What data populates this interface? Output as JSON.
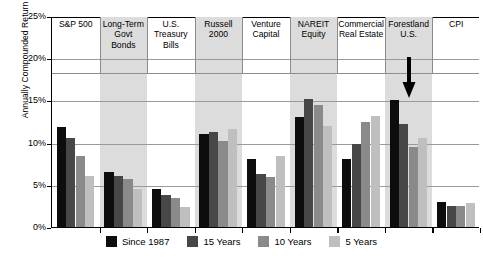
{
  "chart_data": {
    "type": "bar",
    "title": "",
    "subtitle": "",
    "xlabel": "",
    "ylabel": "Annually Compounded Return",
    "ylim": [
      0,
      25
    ],
    "ytick_labels": [
      "0%",
      "5%",
      "10%",
      "15%",
      "20%",
      "25%"
    ],
    "ytick_values": [
      0,
      5,
      10,
      15,
      20,
      25
    ],
    "grid": true,
    "legend_position": "bottom",
    "categories": [
      "S&P 500",
      "Long-Term Govt Bonds",
      "U.S. Treasury Bills",
      "Russell 2000",
      "Venture Capital",
      "NAREIT Equity",
      "Commercial Real Estate",
      "Forestland U.S.",
      "CPI"
    ],
    "category_lines": [
      [
        "S&P 500"
      ],
      [
        "Long-Term",
        "Govt",
        "Bonds"
      ],
      [
        "U.S.",
        "Treasury",
        "Bills"
      ],
      [
        "Russell",
        "2000"
      ],
      [
        "Venture",
        "Capital"
      ],
      [
        "NAREIT",
        "Equity"
      ],
      [
        "Commercial",
        "Real Estate"
      ],
      [
        "Forestland",
        "U.S."
      ],
      [
        "CPI"
      ]
    ],
    "series": [
      {
        "name": "Since 1987",
        "color": "#0d0d0d",
        "values": [
          11.8,
          6.5,
          4.5,
          11.0,
          8.1,
          13.0,
          8.0,
          15.0,
          3.0
        ]
      },
      {
        "name": "15 Years",
        "color": "#474747",
        "values": [
          10.5,
          6.0,
          3.8,
          11.3,
          6.3,
          15.2,
          9.8,
          12.2,
          2.5
        ]
      },
      {
        "name": "10 Years",
        "color": "#8a8a8a",
        "values": [
          8.4,
          5.7,
          3.4,
          10.2,
          5.9,
          14.5,
          12.5,
          9.5,
          2.5
        ]
      },
      {
        "name": "5 Years",
        "color": "#bfbfbf",
        "values": [
          6.1,
          4.5,
          2.4,
          11.6,
          8.4,
          12.0,
          13.2,
          10.6,
          2.8
        ]
      }
    ],
    "annotations": [
      {
        "name": "down-arrow",
        "category": "Forestland U.S.",
        "glyph": "down-arrow",
        "color": "#000000"
      }
    ],
    "shaded_categories": [
      "Long-Term Govt Bonds",
      "Russell 2000",
      "NAREIT Equity",
      "Forestland U.S."
    ]
  },
  "legend": {
    "items": [
      {
        "label": "Since 1987",
        "color": "#0d0d0d"
      },
      {
        "label": "15 Years",
        "color": "#474747"
      },
      {
        "label": "10 Years",
        "color": "#8a8a8a"
      },
      {
        "label": "5 Years",
        "color": "#bfbfbf"
      }
    ]
  }
}
